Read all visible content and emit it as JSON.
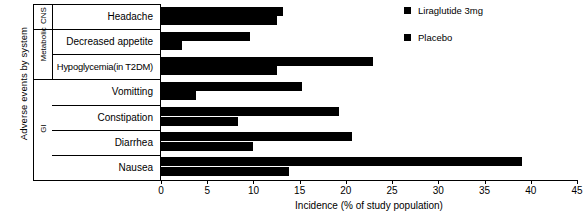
{
  "chart_data": {
    "type": "bar",
    "orientation": "horizontal",
    "title": "",
    "xlabel": "Incidence (% of study population)",
    "ylabel": "Adverse events by system",
    "xlim": [
      0,
      45
    ],
    "xticks": [
      0,
      5,
      10,
      15,
      20,
      25,
      30,
      35,
      40,
      45
    ],
    "grid": false,
    "legend_position": "top-right",
    "categories": [
      "Headache",
      "Decreased appetite",
      "Hypoglycemia(in T2DM)",
      "Vomitting",
      "Constipation",
      "Diarrhea",
      "Nausea"
    ],
    "groups": [
      {
        "label": "CNS",
        "categories": [
          "Headache"
        ]
      },
      {
        "label": "Metabolic",
        "categories": [
          "Decreased appetite",
          "Hypoglycemia(in T2DM)"
        ]
      },
      {
        "label": "GI",
        "categories": [
          "Vomitting",
          "Constipation",
          "Diarrhea",
          "Nausea"
        ]
      }
    ],
    "series": [
      {
        "name": "Liraglutide 3mg",
        "color": "#000000",
        "values": [
          13.2,
          9.6,
          22.9,
          15.3,
          19.3,
          20.7,
          39.0
        ]
      },
      {
        "name": "Placebo",
        "color": "#000000",
        "values": [
          12.6,
          2.3,
          12.6,
          3.8,
          8.3,
          9.9,
          13.8
        ]
      }
    ]
  },
  "legend": {
    "items": [
      {
        "label": "Liraglutide 3mg"
      },
      {
        "label": "Placebo"
      }
    ]
  }
}
